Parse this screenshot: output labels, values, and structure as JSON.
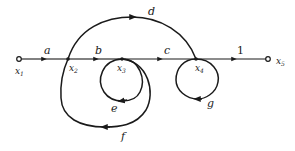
{
  "diagram": {
    "type": "signal-flow-graph",
    "colors": {
      "line": "#1a1a1a",
      "background": "#ffffff"
    },
    "nodes": [
      {
        "id": "x1",
        "label": "x",
        "sub": "1",
        "x": 19,
        "y": 59
      },
      {
        "id": "x2",
        "label": "x",
        "sub": "2",
        "x": 68,
        "y": 59
      },
      {
        "id": "x3",
        "label": "x",
        "sub": "3",
        "x": 122,
        "y": 59
      },
      {
        "id": "x4",
        "label": "x",
        "sub": "4",
        "x": 196,
        "y": 59
      },
      {
        "id": "x5",
        "label": "x",
        "sub": "5",
        "x": 268,
        "y": 59
      }
    ],
    "branches": [
      {
        "id": "a",
        "from": "x1",
        "to": "x2",
        "gain": "a"
      },
      {
        "id": "b",
        "from": "x2",
        "to": "x3",
        "gain": "b"
      },
      {
        "id": "c",
        "from": "x3",
        "to": "x4",
        "gain": "c"
      },
      {
        "id": "one",
        "from": "x4",
        "to": "x5",
        "gain": "1"
      },
      {
        "id": "d",
        "from": "x2",
        "to": "x4",
        "gain": "d"
      },
      {
        "id": "e",
        "from": "x3",
        "to": "x3",
        "gain": "e"
      },
      {
        "id": "f",
        "from": "x3",
        "to": "x2",
        "gain": "f"
      },
      {
        "id": "g",
        "from": "x4",
        "to": "x4",
        "gain": "g"
      }
    ]
  }
}
